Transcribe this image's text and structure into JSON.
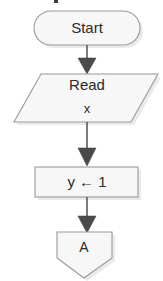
{
  "diagram": {
    "colors": {
      "shape_fill": "#f7f7f7",
      "shape_stroke": "#9a9a9a",
      "shape_shadow": "#d9d9d9",
      "connector": "#5a5a5a",
      "arrowhead": "#4a4a4a",
      "text": "#2b2b2b",
      "background": "#ffffff"
    },
    "nodes": [
      {
        "id": "start",
        "shape": "terminator-stadium",
        "label": "Start",
        "icon": "terminator-shape"
      },
      {
        "id": "read",
        "shape": "parallelogram-io",
        "label": "Read",
        "label_line2": "x",
        "icon": "input-output-shape"
      },
      {
        "id": "assign",
        "shape": "rectangle-process",
        "label": "y ← 1",
        "icon": "process-shape"
      },
      {
        "id": "connector-a",
        "shape": "pentagon-offpage-connector",
        "label": "A",
        "icon": "offpage-connector-shape"
      }
    ],
    "edges": [
      {
        "id": "e1",
        "from": "start",
        "to": "read",
        "label": ""
      },
      {
        "id": "e2",
        "from": "read",
        "to": "assign",
        "label": ""
      },
      {
        "id": "e3",
        "from": "assign",
        "to": "connector-a",
        "label": ""
      }
    ]
  }
}
